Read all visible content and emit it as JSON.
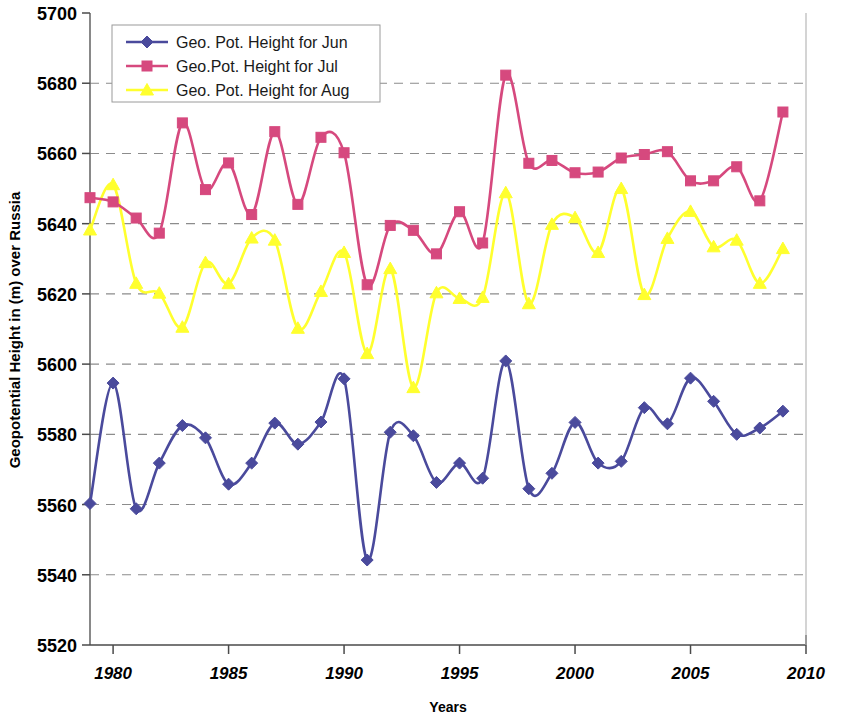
{
  "chart_data": {
    "type": "line",
    "title": "",
    "xlabel": "Years",
    "ylabel": "Geopotential Height in (m) over Russia",
    "xlim": [
      1979,
      2010
    ],
    "ylim": [
      5520,
      5700
    ],
    "xticks": [
      1980,
      1985,
      1990,
      1995,
      2000,
      2005,
      2010
    ],
    "yticks": [
      5520,
      5540,
      5560,
      5580,
      5600,
      5620,
      5640,
      5660,
      5680,
      5700
    ],
    "grid": "horizontal-dashed",
    "legend_position": "top-left-inside",
    "x": [
      1979,
      1980,
      1981,
      1982,
      1983,
      1984,
      1985,
      1986,
      1987,
      1988,
      1989,
      1990,
      1991,
      1992,
      1993,
      1994,
      1995,
      1996,
      1997,
      1998,
      1999,
      2000,
      2001,
      2002,
      2003,
      2004,
      2005,
      2006,
      2007,
      2008,
      2009
    ],
    "series": [
      {
        "name": "Geo. Pot. Height for Jun",
        "color": "#4a4a9c",
        "marker": "diamond",
        "values": [
          5560.3,
          5594.6,
          5558.8,
          5571.8,
          5582.5,
          5579.0,
          5565.8,
          5571.8,
          5583.2,
          5577.2,
          5583.5,
          5595.8,
          5544.2,
          5580.6,
          5579.6,
          5566.3,
          5571.8,
          5567.5,
          5600.9,
          5564.5,
          5568.9,
          5583.4,
          5571.8,
          5572.3,
          5587.6,
          5583.0,
          5596.0,
          5589.4,
          5580.0,
          5581.8,
          5586.6
        ]
      },
      {
        "name": "Geo.Pot. Height for Jul",
        "color": "#d6497e",
        "marker": "square",
        "values": [
          5647.4,
          5646.2,
          5641.6,
          5637.3,
          5668.7,
          5649.7,
          5657.3,
          5642.6,
          5666.2,
          5645.5,
          5664.6,
          5660.2,
          5622.6,
          5639.5,
          5638.1,
          5631.4,
          5643.4,
          5634.5,
          5682.3,
          5657.2,
          5658.0,
          5654.5,
          5654.7,
          5658.7,
          5659.7,
          5660.5,
          5652.2,
          5652.2,
          5656.2,
          5646.5,
          5671.8
        ]
      },
      {
        "name": "Geo. Pot. Height for Aug",
        "color": "#ffff2e",
        "marker": "triangle",
        "values": [
          5638.2,
          5651.1,
          5623.0,
          5620.2,
          5610.5,
          5628.9,
          5622.9,
          5635.9,
          5635.3,
          5610.2,
          5620.7,
          5631.8,
          5603.0,
          5627.2,
          5593.3,
          5620.3,
          5618.7,
          5619.0,
          5648.8,
          5617.2,
          5639.8,
          5641.7,
          5631.8,
          5650.0,
          5619.8,
          5635.8,
          5643.5,
          5633.4,
          5635.3,
          5623.0,
          5632.9
        ]
      }
    ]
  },
  "legend": {
    "entries": [
      {
        "label": "Geo. Pot. Height for Jun"
      },
      {
        "label": "Geo.Pot. Height for Jul"
      },
      {
        "label": "Geo. Pot. Height for Aug"
      }
    ]
  },
  "axes": {
    "y_title": "Geopotential Height in (m) over Russia",
    "x_title": "Years",
    "y_tick_labels": [
      "5700",
      "5680",
      "5660",
      "5640",
      "5620",
      "5600",
      "5580",
      "5560",
      "5540",
      "5520"
    ],
    "x_tick_labels": [
      "1980",
      "1985",
      "1990",
      "1995",
      "2000",
      "2005",
      "2010"
    ]
  },
  "colors": {
    "jun": "#4a4a9c",
    "jul": "#d6497e",
    "aug": "#ffff2e",
    "grid": "#8c8c8c",
    "axis": "#6b6b6b"
  }
}
